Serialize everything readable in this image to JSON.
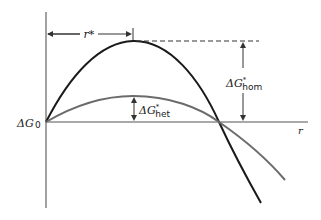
{
  "diagram": {
    "type": "free-energy-vs-radius",
    "axes": {
      "y_label": "ΔG",
      "origin_label": "0",
      "x_label": "r"
    },
    "annotations": {
      "critical_radius": "r*",
      "hom_barrier": {
        "base": "ΔG",
        "sup": "*",
        "sub": "hom"
      },
      "het_barrier": {
        "base": "ΔG",
        "sup": "*",
        "sub": "het"
      }
    },
    "curves": [
      {
        "name": "homogeneous",
        "color": "#1a1a1a",
        "peak": "ΔG*hom at r*"
      },
      {
        "name": "heterogeneous",
        "color": "#6b6b6b",
        "peak": "ΔG*het at r*"
      }
    ],
    "colors": {
      "axis": "#555555",
      "hom_curve": "#1a1a1a",
      "het_curve": "#6b6b6b",
      "annotation": "#333333"
    }
  }
}
